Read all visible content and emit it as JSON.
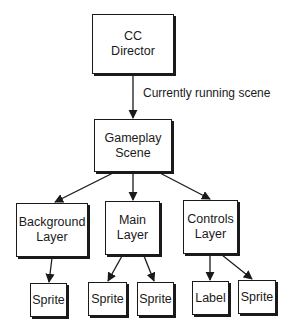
{
  "diagram": {
    "nodes": {
      "director": {
        "label": "CC\nDirector"
      },
      "gameplay": {
        "label": "Gameplay\nScene"
      },
      "background": {
        "label": "Background\nLayer"
      },
      "main": {
        "label": "Main\nLayer"
      },
      "controls": {
        "label": "Controls\nLayer"
      },
      "bg_sprite": {
        "label": "Sprite"
      },
      "main_sprite_1": {
        "label": "Sprite"
      },
      "main_sprite_2": {
        "label": "Sprite"
      },
      "ctrl_label": {
        "label": "Label"
      },
      "ctrl_sprite": {
        "label": "Sprite"
      }
    },
    "edges": [
      {
        "from": "director",
        "to": "gameplay",
        "label": "Currently running scene"
      },
      {
        "from": "gameplay",
        "to": "background",
        "label": ""
      },
      {
        "from": "gameplay",
        "to": "main",
        "label": ""
      },
      {
        "from": "gameplay",
        "to": "controls",
        "label": ""
      },
      {
        "from": "background",
        "to": "bg_sprite",
        "label": ""
      },
      {
        "from": "main",
        "to": "main_sprite_1",
        "label": ""
      },
      {
        "from": "main",
        "to": "main_sprite_2",
        "label": ""
      },
      {
        "from": "controls",
        "to": "ctrl_label",
        "label": ""
      },
      {
        "from": "controls",
        "to": "ctrl_sprite",
        "label": ""
      }
    ],
    "edge_label_running": "Currently running scene"
  }
}
